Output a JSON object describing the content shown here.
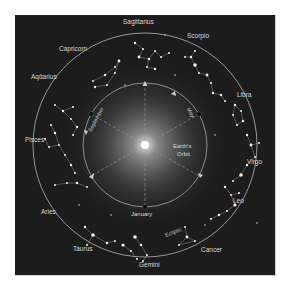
{
  "diagram": {
    "colors": {
      "background": "#1c1c1c",
      "frame": "#ffffff",
      "ecliptic": "#bbbbbb",
      "orbit": "#a9a9a9",
      "sun": "#ffffff",
      "label": "#d8d8d8"
    },
    "constellations": [
      {
        "name": "Sagittarius",
        "x": 146,
        "y": 12
      },
      {
        "name": "Scorpio",
        "x": 196,
        "y": 32
      },
      {
        "name": "Libra",
        "x": 237,
        "y": 79
      },
      {
        "name": "Virgo",
        "x": 246,
        "y": 158
      },
      {
        "name": "Leo",
        "x": 233,
        "y": 185
      },
      {
        "name": "Cancer",
        "x": 205,
        "y": 238
      },
      {
        "name": "Gemini",
        "x": 137,
        "y": 252
      },
      {
        "name": "Taurus",
        "x": 83,
        "y": 236
      },
      {
        "name": "Aries",
        "x": 47,
        "y": 202
      },
      {
        "name": "Pisces",
        "x": 32,
        "y": 140
      },
      {
        "name": "Aquarius",
        "x": 44,
        "y": 75
      },
      {
        "name": "Capricorn",
        "x": 75,
        "y": 49
      }
    ],
    "orbit_label": [
      "Earth's",
      "Orbit"
    ],
    "month_labels": [
      {
        "name": "January"
      },
      {
        "name": "May"
      },
      {
        "name": "September"
      }
    ],
    "ecliptic_label": "Ecliptic"
  }
}
